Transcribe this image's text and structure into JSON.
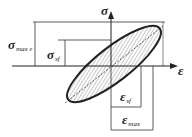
{
  "diagram": {
    "title": "",
    "type": "stress-strain hysteresis loop",
    "axes": {
      "y_label": "σ",
      "x_label": "ε"
    },
    "labels": {
      "sigma_max": {
        "symbol": "σ",
        "subscript": "max ε"
      },
      "sigma_sf": {
        "symbol": "σ",
        "subscript": "sf"
      },
      "eps_sf": {
        "symbol": "ε",
        "subscript": "sf"
      },
      "eps_max": {
        "symbol": "ε",
        "subscript": "max"
      }
    },
    "colors": {
      "line": "#222222",
      "hatch": "#555555",
      "background": "#ffffff"
    }
  }
}
